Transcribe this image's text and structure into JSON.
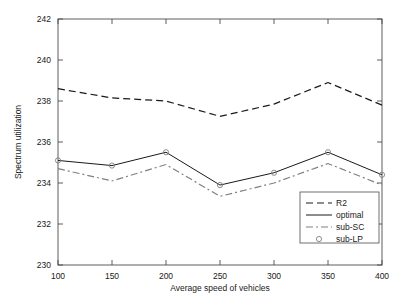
{
  "chart_data": {
    "type": "line",
    "title": "",
    "xlabel": "Average speed of vehicles",
    "ylabel": "Spectrum utilization",
    "x": [
      100,
      150,
      200,
      250,
      300,
      350,
      400
    ],
    "xlim": [
      100,
      400
    ],
    "ylim": [
      230,
      242
    ],
    "xticks": [
      100,
      150,
      200,
      250,
      300,
      350,
      400
    ],
    "yticks": [
      230,
      232,
      234,
      236,
      238,
      240,
      242
    ],
    "xtick_labels": [
      "100",
      "150",
      "200",
      "250",
      "300",
      "350",
      "400"
    ],
    "ytick_labels": [
      "230",
      "232",
      "234",
      "236",
      "238",
      "240",
      "242"
    ],
    "grid": false,
    "legend_position": "lower right",
    "series": [
      {
        "name": "R2",
        "style": "dashed",
        "marker": "none",
        "color": "#1a1a1a",
        "values": [
          238.6,
          238.15,
          238.0,
          237.25,
          237.85,
          238.9,
          237.8
        ]
      },
      {
        "name": "optimal",
        "style": "solid",
        "marker": "none",
        "color": "#1a1a1a",
        "values": [
          235.1,
          234.85,
          235.5,
          233.9,
          234.5,
          235.5,
          234.4
        ]
      },
      {
        "name": "sub-SC",
        "style": "dashdot",
        "marker": "none",
        "color": "#808080",
        "values": [
          234.7,
          234.1,
          234.9,
          233.35,
          234.0,
          234.95,
          233.9
        ]
      },
      {
        "name": "sub-LP",
        "style": "none",
        "marker": "circle",
        "color": "#808080",
        "values": [
          235.1,
          234.85,
          235.5,
          233.9,
          234.5,
          235.5,
          234.4
        ]
      }
    ]
  },
  "legend": {
    "entries": [
      {
        "label": "R2"
      },
      {
        "label": "optimal"
      },
      {
        "label": "sub-SC"
      },
      {
        "label": "sub-LP"
      }
    ]
  },
  "axes": {
    "x_title": "Average speed of vehicles",
    "y_title": "Spectrum utilization"
  }
}
